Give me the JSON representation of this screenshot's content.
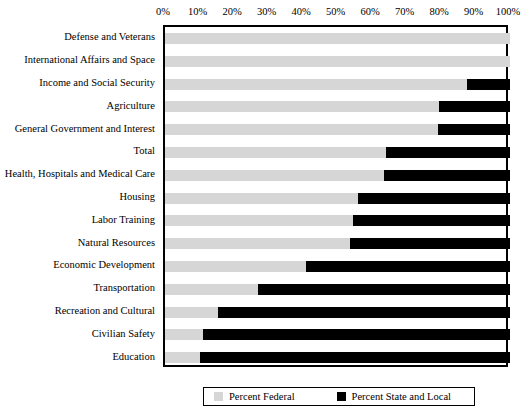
{
  "chart_data": {
    "type": "bar",
    "orientation": "horizontal",
    "stacked": true,
    "title": "",
    "subtitle": "",
    "xlabel": "",
    "ylabel": "",
    "xlim": [
      0,
      100
    ],
    "xticks": [
      0,
      10,
      20,
      30,
      40,
      50,
      60,
      70,
      80,
      90,
      100
    ],
    "xtick_labels": [
      "0%",
      "10%",
      "20%",
      "30%",
      "40%",
      "50%",
      "60%",
      "70%",
      "80%",
      "90%",
      "100%"
    ],
    "grid": false,
    "legend_position": "bottom",
    "categories": [
      "Defense and Veterans",
      "International Affairs and Space",
      "Income and Social Security",
      "Agriculture",
      "General Government and Interest",
      "Total",
      "Health, Hospitals and Medical Care",
      "Housing",
      "Labor Training",
      "Natural Resources",
      "Economic Development",
      "Transportation",
      "Recreation and Cultural",
      "Civilian Safety",
      "Education"
    ],
    "series": [
      {
        "name": "Percent Federal",
        "color": "#d6d6d6",
        "values": [
          100,
          100,
          87.5,
          79.5,
          79,
          64,
          63.5,
          56,
          54.5,
          53.5,
          41,
          27,
          15.5,
          11,
          10
        ]
      },
      {
        "name": "Percent State and Local",
        "color": "#000000",
        "values": [
          0,
          0,
          12.5,
          20.5,
          21,
          36,
          36.5,
          44,
          45.5,
          46.5,
          59,
          73,
          84.5,
          89,
          90
        ]
      }
    ]
  },
  "legend": {
    "entries": [
      {
        "label": "Percent Federal",
        "color": "#d6d6d6"
      },
      {
        "label": "Percent State and Local",
        "color": "#000000"
      }
    ]
  }
}
